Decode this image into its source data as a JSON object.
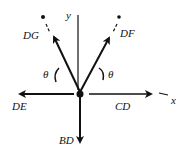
{
  "diagram": {
    "type": "free-body diagram",
    "joint": "D",
    "axes": {
      "x_label": "x",
      "y_label": "y"
    },
    "forces": [
      {
        "name": "DG",
        "label": "DG",
        "direction": "up-left",
        "angle_from_vertical": "θ"
      },
      {
        "name": "DF",
        "label": "DF",
        "direction": "up-right",
        "angle_from_vertical": "θ"
      },
      {
        "name": "DE",
        "label": "DE",
        "direction": "left"
      },
      {
        "name": "CD",
        "label": "CD",
        "direction": "right"
      },
      {
        "name": "BD",
        "label": "BD",
        "direction": "down"
      }
    ],
    "angles": [
      {
        "label": "θ",
        "side": "left"
      },
      {
        "label": "θ",
        "side": "right"
      }
    ],
    "colors": {
      "ink": "#111111",
      "background": "#ffffff"
    }
  }
}
